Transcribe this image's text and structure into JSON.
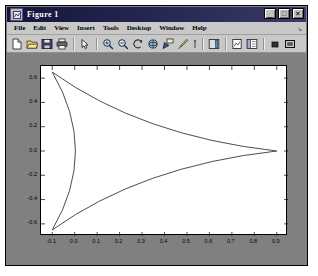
{
  "window": {
    "title": "Figure 1",
    "icon": "figure-icon",
    "controls": [
      {
        "name": "minimize-button",
        "glyph": "_"
      },
      {
        "name": "maximize-button",
        "glyph": "□"
      },
      {
        "name": "close-button",
        "glyph": "✕"
      }
    ]
  },
  "menubar": {
    "items": [
      {
        "name": "menu-file",
        "label": "File"
      },
      {
        "name": "menu-edit",
        "label": "Edit"
      },
      {
        "name": "menu-view",
        "label": "View"
      },
      {
        "name": "menu-insert",
        "label": "Insert"
      },
      {
        "name": "menu-tools",
        "label": "Tools"
      },
      {
        "name": "menu-desktop",
        "label": "Desktop"
      },
      {
        "name": "menu-window",
        "label": "Window"
      },
      {
        "name": "menu-help",
        "label": "Help"
      }
    ],
    "overflow_arrow": "↘"
  },
  "toolbar": {
    "buttons": [
      {
        "name": "new-figure-icon",
        "label": "New Figure"
      },
      {
        "name": "open-file-icon",
        "label": "Open File"
      },
      {
        "name": "save-figure-icon",
        "label": "Save Figure"
      },
      {
        "name": "print-figure-icon",
        "label": "Print Figure"
      },
      {
        "name": "edit-plot-arrow-icon",
        "label": "Edit Plot"
      },
      {
        "name": "zoom-in-icon",
        "label": "Zoom In"
      },
      {
        "name": "zoom-out-icon",
        "label": "Zoom Out"
      },
      {
        "name": "pan-icon",
        "label": "Pan"
      },
      {
        "name": "rotate-3d-icon",
        "label": "Rotate 3D"
      },
      {
        "name": "data-cursor-icon",
        "label": "Data Cursor"
      },
      {
        "name": "brush-icon",
        "label": "Brush/Select Data"
      },
      {
        "name": "link-plot-icon",
        "label": "Link Plot"
      },
      {
        "name": "insert-colorbar-icon",
        "label": "Insert Colorbar"
      },
      {
        "name": "insert-legend-icon",
        "label": "Insert Legend"
      },
      {
        "name": "hide-plot-tools-icon",
        "label": "Hide Plot Tools"
      },
      {
        "name": "show-plot-tools-icon",
        "label": "Show Plot Tools"
      }
    ]
  },
  "chart_data": {
    "type": "line",
    "title": "",
    "xlabel": "",
    "ylabel": "",
    "xlim": [
      -0.15,
      0.95
    ],
    "ylim": [
      -0.7,
      0.7
    ],
    "grid": false,
    "legend": null,
    "xticks": [
      "-0.1",
      "0.0",
      "0.1",
      "0.2",
      "0.3",
      "0.4",
      "0.5",
      "0.6",
      "0.7",
      "0.8",
      "0.9"
    ],
    "xtick_values": [
      -0.1,
      0.0,
      0.1,
      0.2,
      0.3,
      0.4,
      0.5,
      0.6,
      0.7,
      0.8,
      0.9
    ],
    "yticks": [
      "0.6",
      "0.4",
      "0.2",
      "0.0",
      "-0.2",
      "-0.4",
      "-0.6"
    ],
    "ytick_values": [
      0.6,
      0.4,
      0.2,
      0.0,
      -0.2,
      -0.4,
      -0.6
    ],
    "series": [
      {
        "name": "deltoid",
        "description": "Deltoid (3-cusped hypocycloid) with cusps at (-0.1, 0.65), (-0.1, -0.65) and (0.9, 0.0)",
        "color": "#3a3a3a",
        "cusps": [
          [
            -0.1,
            0.65
          ],
          [
            -0.1,
            -0.65
          ],
          [
            0.9,
            0.0
          ]
        ],
        "x": [
          -0.1,
          -0.09,
          -0.06,
          -0.02,
          0.04,
          0.1,
          0.18,
          0.26,
          0.35,
          0.44,
          0.53,
          0.62,
          0.7,
          0.78,
          0.84,
          0.88,
          0.9,
          0.88,
          0.84,
          0.78,
          0.7,
          0.62,
          0.53,
          0.44,
          0.35,
          0.26,
          0.18,
          0.1,
          0.04,
          -0.02,
          -0.06,
          -0.09,
          -0.1,
          -0.07,
          -0.03,
          0.01,
          0.04,
          0.05,
          0.04,
          0.01,
          -0.03,
          -0.07,
          -0.1
        ],
        "y": [
          0.65,
          0.637,
          0.614,
          0.583,
          0.545,
          0.503,
          0.455,
          0.405,
          0.353,
          0.3,
          0.248,
          0.196,
          0.147,
          0.101,
          0.062,
          0.028,
          0.0,
          -0.028,
          -0.062,
          -0.101,
          -0.147,
          -0.196,
          -0.248,
          -0.3,
          -0.353,
          -0.405,
          -0.455,
          -0.503,
          -0.545,
          -0.583,
          -0.614,
          -0.637,
          -0.65,
          -0.54,
          -0.41,
          -0.24,
          -0.08,
          0.0,
          0.08,
          0.24,
          0.41,
          0.54,
          0.65
        ]
      }
    ]
  }
}
